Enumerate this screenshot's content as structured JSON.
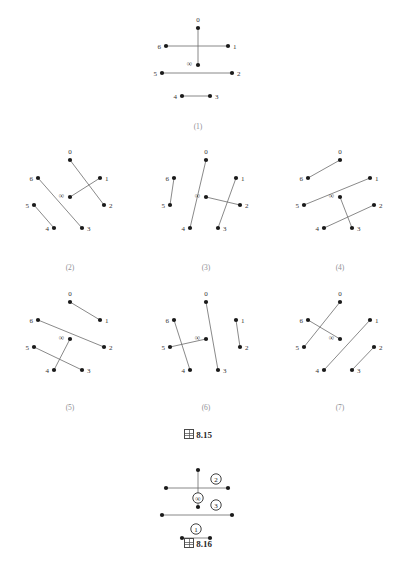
{
  "page": {
    "running_head": "",
    "width": 396,
    "height": 576,
    "background": "#ffffff",
    "ink_color": "#1a1a1a",
    "edge_color": "#6b6b6b",
    "label_color": "#333333"
  },
  "figure_815": {
    "caption_marker": "図",
    "caption_number": "8.15",
    "caption_text": "図 8.15",
    "vertex_labels": [
      "0",
      "1",
      "2",
      "3",
      "4",
      "5",
      "6",
      "∞"
    ],
    "panels": [
      {
        "id": "p1",
        "label": "(1)",
        "vertices": {
          "0": {
            "x": 50,
            "y": 10
          },
          "1": {
            "x": 80,
            "y": 28
          },
          "2": {
            "x": 84,
            "y": 55
          },
          "3": {
            "x": 62,
            "y": 78
          },
          "4": {
            "x": 34,
            "y": 78
          },
          "5": {
            "x": 14,
            "y": 55
          },
          "6": {
            "x": 18,
            "y": 28
          },
          "inf": {
            "x": 50,
            "y": 47
          }
        },
        "edges": [
          [
            "0",
            "inf"
          ],
          [
            "6",
            "1"
          ],
          [
            "5",
            "2"
          ],
          [
            "4",
            "3"
          ]
        ]
      },
      {
        "id": "p2",
        "label": "(2)",
        "vertices": {
          "0": {
            "x": 50,
            "y": 10
          },
          "1": {
            "x": 80,
            "y": 28
          },
          "2": {
            "x": 84,
            "y": 55
          },
          "3": {
            "x": 62,
            "y": 78
          },
          "4": {
            "x": 34,
            "y": 78
          },
          "5": {
            "x": 14,
            "y": 55
          },
          "6": {
            "x": 18,
            "y": 28
          },
          "inf": {
            "x": 50,
            "y": 47
          }
        },
        "edges": [
          [
            "0",
            "2"
          ],
          [
            "6",
            "3"
          ],
          [
            "5",
            "4"
          ],
          [
            "inf",
            "1"
          ]
        ]
      },
      {
        "id": "p3",
        "label": "(3)",
        "vertices": {
          "0": {
            "x": 50,
            "y": 10
          },
          "1": {
            "x": 80,
            "y": 28
          },
          "2": {
            "x": 84,
            "y": 55
          },
          "3": {
            "x": 62,
            "y": 78
          },
          "4": {
            "x": 34,
            "y": 78
          },
          "5": {
            "x": 14,
            "y": 55
          },
          "6": {
            "x": 18,
            "y": 28
          },
          "inf": {
            "x": 50,
            "y": 47
          }
        },
        "edges": [
          [
            "0",
            "4"
          ],
          [
            "6",
            "5"
          ],
          [
            "1",
            "3"
          ],
          [
            "inf",
            "2"
          ]
        ]
      },
      {
        "id": "p4",
        "label": "(4)",
        "vertices": {
          "0": {
            "x": 50,
            "y": 10
          },
          "1": {
            "x": 80,
            "y": 28
          },
          "2": {
            "x": 84,
            "y": 55
          },
          "3": {
            "x": 62,
            "y": 78
          },
          "4": {
            "x": 34,
            "y": 78
          },
          "5": {
            "x": 14,
            "y": 55
          },
          "6": {
            "x": 18,
            "y": 28
          },
          "inf": {
            "x": 50,
            "y": 47
          }
        },
        "edges": [
          [
            "0",
            "6"
          ],
          [
            "5",
            "1"
          ],
          [
            "inf",
            "3"
          ],
          [
            "4",
            "2"
          ]
        ]
      },
      {
        "id": "p5",
        "label": "(5)",
        "vertices": {
          "0": {
            "x": 50,
            "y": 10
          },
          "1": {
            "x": 80,
            "y": 28
          },
          "2": {
            "x": 84,
            "y": 55
          },
          "3": {
            "x": 62,
            "y": 78
          },
          "4": {
            "x": 34,
            "y": 78
          },
          "5": {
            "x": 14,
            "y": 55
          },
          "6": {
            "x": 18,
            "y": 28
          },
          "inf": {
            "x": 50,
            "y": 47
          }
        },
        "edges": [
          [
            "0",
            "1"
          ],
          [
            "6",
            "2"
          ],
          [
            "inf",
            "4"
          ],
          [
            "5",
            "3"
          ]
        ]
      },
      {
        "id": "p6",
        "label": "(6)",
        "vertices": {
          "0": {
            "x": 50,
            "y": 10
          },
          "1": {
            "x": 80,
            "y": 28
          },
          "2": {
            "x": 84,
            "y": 55
          },
          "3": {
            "x": 62,
            "y": 78
          },
          "4": {
            "x": 34,
            "y": 78
          },
          "5": {
            "x": 14,
            "y": 55
          },
          "6": {
            "x": 18,
            "y": 28
          },
          "inf": {
            "x": 50,
            "y": 47
          }
        },
        "edges": [
          [
            "0",
            "3"
          ],
          [
            "6",
            "4"
          ],
          [
            "5",
            "inf"
          ],
          [
            "1",
            "2"
          ]
        ]
      },
      {
        "id": "p7",
        "label": "(7)",
        "vertices": {
          "0": {
            "x": 50,
            "y": 10
          },
          "1": {
            "x": 80,
            "y": 28
          },
          "2": {
            "x": 84,
            "y": 55
          },
          "3": {
            "x": 62,
            "y": 78
          },
          "4": {
            "x": 34,
            "y": 78
          },
          "5": {
            "x": 14,
            "y": 55
          },
          "6": {
            "x": 18,
            "y": 28
          },
          "inf": {
            "x": 50,
            "y": 47
          }
        },
        "edges": [
          [
            "0",
            "5"
          ],
          [
            "6",
            "inf"
          ],
          [
            "4",
            "1"
          ],
          [
            "3",
            "2"
          ]
        ]
      }
    ]
  },
  "figure_816": {
    "caption_marker": "図",
    "caption_number": "8.16",
    "caption_text": "図 8.16",
    "vertices": {
      "0": {
        "x": 50,
        "y": 10
      },
      "1": {
        "x": 80,
        "y": 28
      },
      "2": {
        "x": 84,
        "y": 55
      },
      "3": {
        "x": 62,
        "y": 78
      },
      "4": {
        "x": 34,
        "y": 78
      },
      "5": {
        "x": 14,
        "y": 55
      },
      "6": {
        "x": 18,
        "y": 28
      },
      "inf": {
        "x": 50,
        "y": 47
      }
    },
    "edges": [
      [
        "0",
        "inf"
      ],
      [
        "6",
        "1"
      ],
      [
        "5",
        "2"
      ],
      [
        "4",
        "3"
      ]
    ],
    "edge_annotations": [
      {
        "symbol": "②",
        "plain": "2",
        "x": 68,
        "y": 19
      },
      {
        "symbol": "∞",
        "plain": "inf",
        "x": 50,
        "y": 38
      },
      {
        "symbol": "③",
        "plain": "3",
        "x": 68,
        "y": 45
      },
      {
        "symbol": "①",
        "plain": "1",
        "x": 48,
        "y": 69
      }
    ]
  }
}
